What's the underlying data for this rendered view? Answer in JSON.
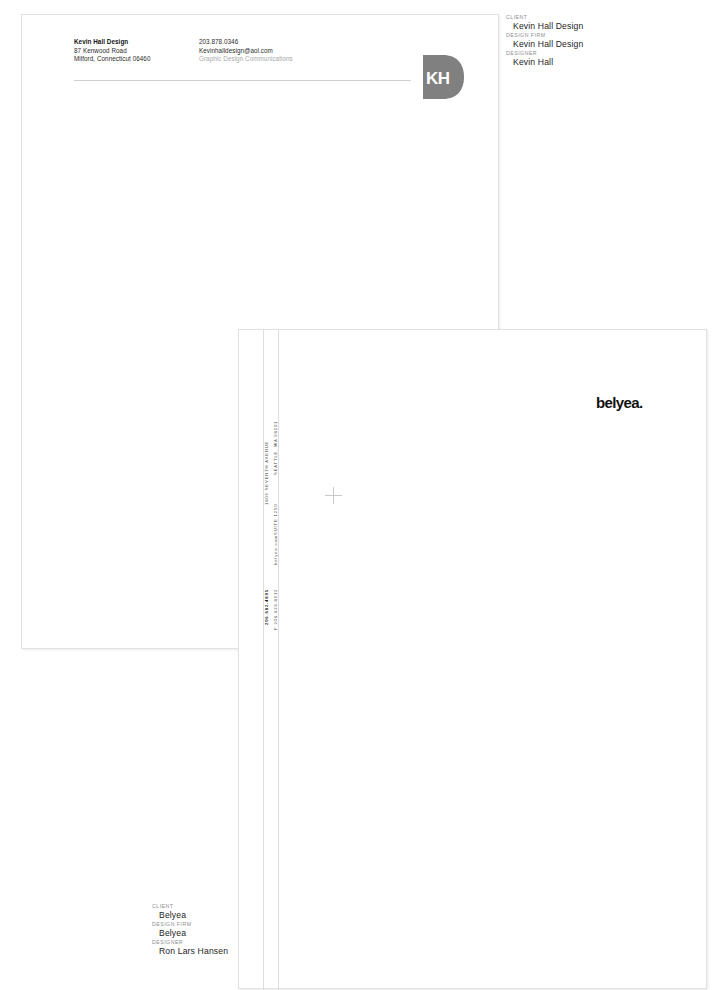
{
  "letterhead": {
    "address_block": [
      {
        "text": "Kevin Hall Design",
        "style": "bold"
      },
      {
        "text": "87 Kenwood Road",
        "style": "normal"
      },
      {
        "text": "Milford, Connecticut 06460",
        "style": "normal"
      }
    ],
    "contact_block": [
      {
        "text": "203.878.0346",
        "style": "normal"
      },
      {
        "text": "Kevinhalldesign@aol.com",
        "style": "normal"
      },
      {
        "text": "Graphic Design Communications",
        "style": "muted"
      }
    ],
    "logo": {
      "letters": "KH",
      "shape": "D",
      "color": "#808080",
      "letter_color": "#ffffff"
    }
  },
  "belyea": {
    "wordmark": "belyea.",
    "wordmark_color": "#111111",
    "vertical_upper": [
      {
        "text": "SEATTLE, WA 98101",
        "style": "light"
      },
      {
        "text": "SUITE 1250",
        "style": "light"
      },
      {
        "text": "1809 SEVENTH AVENUE",
        "style": "light"
      }
    ],
    "vertical_lower": [
      {
        "text": "belyea.com",
        "style": "light"
      },
      {
        "text": "F 206.623.8912",
        "style": "light"
      },
      {
        "text": "206.682.4895",
        "style": "bold"
      }
    ]
  },
  "credits_top": {
    "items": [
      {
        "label": "CLIENT",
        "value": "Kevin Hall Design"
      },
      {
        "label": "DESIGN FIRM",
        "value": "Kevin Hall Design"
      },
      {
        "label": "DESIGNER",
        "value": "Kevin Hall"
      }
    ]
  },
  "credits_bottom": {
    "items": [
      {
        "label": "CLIENT",
        "value": "Belyea"
      },
      {
        "label": "DESIGN FIRM",
        "value": "Belyea"
      },
      {
        "label": "DESIGNER",
        "value": "Ron Lars Hansen"
      }
    ]
  }
}
